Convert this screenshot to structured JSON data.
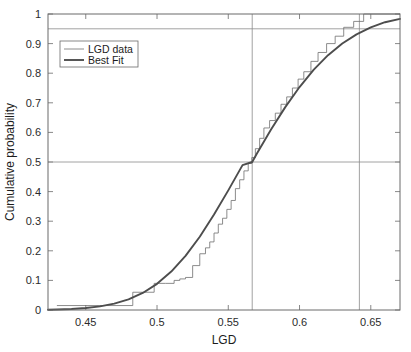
{
  "chart_data": {
    "type": "line",
    "title": "",
    "xlabel": "LGD",
    "ylabel": "Cumulative probability",
    "xlim": [
      0.4235,
      0.6705
    ],
    "ylim": [
      0,
      1
    ],
    "xticks": [
      0.45,
      0.5,
      0.55,
      0.6,
      0.65
    ],
    "xtick_labels": [
      "0.45",
      "0.5",
      "0.55",
      "0.6",
      "0.65"
    ],
    "yticks": [
      0,
      0.1,
      0.2,
      0.3,
      0.4,
      0.5,
      0.6,
      0.7,
      0.8,
      0.9,
      1
    ],
    "ytick_labels": [
      "0",
      "0.1",
      "0.2",
      "0.3",
      "0.4",
      "0.5",
      "0.6",
      "0.7",
      "0.8",
      "0.9",
      "1"
    ],
    "grid": false,
    "legend_position": "upper left",
    "legend_entries": [
      "LGD data",
      "Best Fit"
    ],
    "series": [
      {
        "name": "LGD data",
        "style": "step-post",
        "color": "#6e6e6e",
        "linewidth": 0.8,
        "x": [
          0.43,
          0.462,
          0.483,
          0.498,
          0.506,
          0.512,
          0.516,
          0.52,
          0.525,
          0.53,
          0.534,
          0.537,
          0.54,
          0.543,
          0.546,
          0.549,
          0.552,
          0.555,
          0.558,
          0.561,
          0.564,
          0.5665,
          0.569,
          0.572,
          0.575,
          0.579,
          0.583,
          0.587,
          0.591,
          0.595,
          0.599,
          0.603,
          0.608,
          0.613,
          0.619,
          0.625,
          0.631,
          0.638,
          0.645,
          0.6705
        ],
        "y": [
          0.015,
          0.015,
          0.06,
          0.09,
          0.09,
          0.1,
          0.105,
          0.11,
          0.15,
          0.19,
          0.21,
          0.23,
          0.26,
          0.29,
          0.31,
          0.34,
          0.37,
          0.41,
          0.44,
          0.47,
          0.495,
          0.515,
          0.545,
          0.58,
          0.615,
          0.64,
          0.665,
          0.695,
          0.72,
          0.75,
          0.78,
          0.805,
          0.84,
          0.87,
          0.9,
          0.925,
          0.955,
          0.975,
          1.0,
          1.0
        ]
      },
      {
        "name": "Best Fit",
        "style": "smooth",
        "color": "#4d4d4d",
        "linewidth": 1.9,
        "distribution": "normal-cdf",
        "mu": 0.5668,
        "sigma": 0.0455,
        "x": [
          0.4235,
          0.43,
          0.44,
          0.45,
          0.46,
          0.47,
          0.48,
          0.49,
          0.5,
          0.51,
          0.52,
          0.53,
          0.54,
          0.55,
          0.56,
          0.5668,
          0.57,
          0.58,
          0.59,
          0.6,
          0.61,
          0.62,
          0.63,
          0.64,
          0.65,
          0.66,
          0.6705
        ],
        "y": [
          0.001,
          0.0016,
          0.0034,
          0.0066,
          0.0122,
          0.0214,
          0.0359,
          0.0576,
          0.0884,
          0.1299,
          0.183,
          0.2476,
          0.3223,
          0.4042,
          0.4894,
          0.5,
          0.5279,
          0.6096,
          0.6854,
          0.7533,
          0.8119,
          0.8608,
          0.9003,
          0.9313,
          0.9549,
          0.9722,
          0.9835
        ]
      }
    ],
    "reference_lines": [
      {
        "orientation": "horizontal",
        "value": 0.95,
        "label": "0.95 quantile level",
        "color": "#8a8a8a"
      },
      {
        "orientation": "horizontal",
        "value": 0.5,
        "label": "median level",
        "color": "#8a8a8a"
      },
      {
        "orientation": "vertical",
        "value": 0.5668,
        "label": "median LGD",
        "color": "#8a8a8a"
      },
      {
        "orientation": "vertical",
        "value": 0.642,
        "label": "0.95 quantile LGD",
        "color": "#8a8a8a"
      }
    ]
  },
  "axes": {
    "frame_color": "#6a6a6a",
    "background": "#ffffff"
  }
}
